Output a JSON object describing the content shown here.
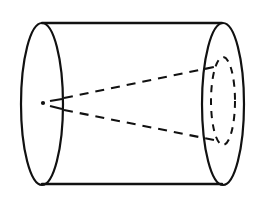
{
  "figure": {
    "canvas": {
      "width": 259,
      "height": 198,
      "background_color": "#ffffff",
      "ink_color": "#111111"
    },
    "caption": "",
    "elements": {
      "left_ellipse": {
        "name": "left-end-ellipse",
        "role": "near circular face of the cylinder drawn in perspective",
        "style": "solid",
        "center_x": 42,
        "center_y": 104,
        "radius_x": 21,
        "radius_y": 81,
        "stroke_width": 2.2
      },
      "right_ellipse": {
        "name": "right-end-ellipse",
        "role": "far circular face of the cylinder drawn in perspective",
        "style": "solid",
        "center_x": 223,
        "center_y": 104,
        "radius_x": 21,
        "radius_y": 81,
        "stroke_width": 2.2
      },
      "inner_ellipse": {
        "name": "inner-dashed-ellipse",
        "role": "hidden smaller ellipse on the far face where the cone rays land",
        "style": "dashed",
        "center_x": 223,
        "center_y": 101,
        "radius_x": 12,
        "radius_y": 44,
        "stroke_width": 2.0,
        "dash_pattern": "7 6"
      },
      "top_edge": {
        "name": "top-silhouette-line",
        "role": "upper tangent line joining the two end ellipses",
        "style": "solid",
        "x1": 42,
        "y1": 23,
        "x2": 222,
        "y2": 23,
        "stroke_width": 2.4
      },
      "bottom_edge": {
        "name": "bottom-silhouette-line",
        "role": "lower tangent line joining the two end ellipses",
        "style": "solid",
        "x1": 42,
        "y1": 184,
        "x2": 222,
        "y2": 184,
        "stroke_width": 2.4
      },
      "apex_dot": {
        "name": "apex-point",
        "role": "vertex point from which the dashed cone rays emanate",
        "center_x": 43,
        "center_y": 103,
        "radius": 2.1
      },
      "apex_stub_upper": {
        "name": "apex-stub-upper",
        "role": "short dash between the apex point and the near ellipse, upper ray",
        "style": "dashed",
        "x1": 50,
        "y1": 101,
        "x2": 62,
        "y2": 99,
        "stroke_width": 2.0
      },
      "apex_stub_lower": {
        "name": "apex-stub-lower",
        "role": "short dash between the apex point and the near ellipse, lower ray",
        "style": "dashed",
        "x1": 50,
        "y1": 106,
        "x2": 62,
        "y2": 109,
        "stroke_width": 2.0
      },
      "upper_ray": {
        "name": "upper-cone-ray",
        "role": "dashed ray running from the apex to the top of the inner ellipse",
        "style": "dashed",
        "x1": 64,
        "y1": 98,
        "x2": 214,
        "y2": 67,
        "stroke_width": 2.1,
        "dash_pattern": "9 7"
      },
      "lower_ray": {
        "name": "lower-cone-ray",
        "role": "dashed ray running from the apex to the bottom of the inner ellipse",
        "style": "dashed",
        "x1": 64,
        "y1": 110,
        "x2": 214,
        "y2": 140,
        "stroke_width": 2.1,
        "dash_pattern": "9 7"
      }
    }
  }
}
